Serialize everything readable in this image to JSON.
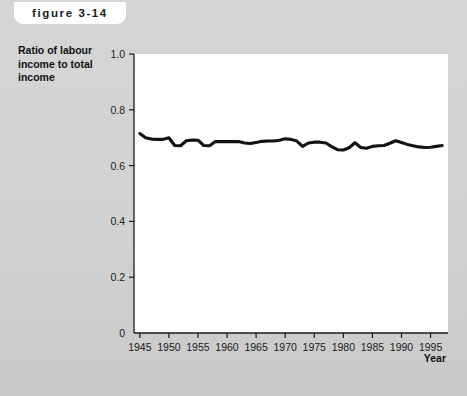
{
  "figure": {
    "tag_label": "figure 3-14",
    "background_color": "#d2d2d2",
    "plot_background_color": "#ffffff",
    "line_color": "#111111"
  },
  "chart_data": {
    "type": "line",
    "title": "",
    "subtitle": "",
    "xlabel": "Year",
    "ylabel": "Ratio of labour\nincome to total\nincome",
    "ylabel_lines": [
      "Ratio of labour",
      "income to total",
      "income"
    ],
    "xlim": [
      1944,
      1998
    ],
    "ylim": [
      0,
      1.0
    ],
    "yticks": [
      0,
      0.2,
      0.4,
      0.6,
      0.8,
      1.0
    ],
    "ytick_labels": [
      "0",
      "0.2",
      "0.4",
      "0.6",
      "0.8",
      "1.0"
    ],
    "xticks": [
      1945,
      1950,
      1955,
      1960,
      1965,
      1970,
      1975,
      1980,
      1985,
      1990,
      1995
    ],
    "xtick_labels": [
      "1945",
      "1950",
      "1955",
      "1960",
      "1965",
      "1970",
      "1975",
      "1980",
      "1985",
      "1990",
      "1995"
    ],
    "grid": false,
    "legend": null,
    "series": [
      {
        "name": "Ratio of labour income to total income",
        "x": [
          1945,
          1946,
          1947,
          1948,
          1949,
          1950,
          1951,
          1952,
          1953,
          1954,
          1955,
          1956,
          1957,
          1958,
          1959,
          1960,
          1961,
          1962,
          1963,
          1964,
          1965,
          1966,
          1967,
          1968,
          1969,
          1970,
          1971,
          1972,
          1973,
          1974,
          1975,
          1976,
          1977,
          1978,
          1979,
          1980,
          1981,
          1982,
          1983,
          1984,
          1985,
          1986,
          1987,
          1988,
          1989,
          1990,
          1991,
          1992,
          1993,
          1994,
          1995,
          1996,
          1997
        ],
        "values": [
          0.715,
          0.7,
          0.695,
          0.694,
          0.694,
          0.7,
          0.672,
          0.671,
          0.689,
          0.692,
          0.691,
          0.672,
          0.671,
          0.686,
          0.686,
          0.686,
          0.686,
          0.686,
          0.681,
          0.679,
          0.683,
          0.687,
          0.688,
          0.688,
          0.691,
          0.696,
          0.694,
          0.688,
          0.669,
          0.681,
          0.684,
          0.684,
          0.681,
          0.668,
          0.657,
          0.656,
          0.664,
          0.682,
          0.665,
          0.662,
          0.669,
          0.671,
          0.672,
          0.68,
          0.689,
          0.683,
          0.676,
          0.671,
          0.667,
          0.665,
          0.666,
          0.669,
          0.672
        ]
      }
    ]
  }
}
